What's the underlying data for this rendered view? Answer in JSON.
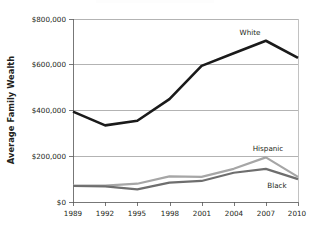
{
  "chart_data": {
    "type": "line",
    "title": "",
    "xlabel": "",
    "ylabel": "Average Family Wealth",
    "categories": [
      "1989",
      "1992",
      "1995",
      "1998",
      "2001",
      "2004",
      "2007",
      "2010"
    ],
    "ylim": [
      0,
      800000
    ],
    "yticks": [
      0,
      200000,
      400000,
      600000,
      800000
    ],
    "ytick_labels": [
      "$0",
      "$200,000",
      "$400,000",
      "$600,000",
      "$800,000"
    ],
    "grid": true,
    "legend_position": "inline-labels",
    "series": [
      {
        "name": "White",
        "color": "#1a1a1a",
        "values": [
          395000,
          335000,
          355000,
          450000,
          595000,
          650000,
          705000,
          630000
        ]
      },
      {
        "name": "Hispanic",
        "color": "#a6a6a6",
        "values": [
          72000,
          72000,
          80000,
          112000,
          110000,
          145000,
          195000,
          110000
        ]
      },
      {
        "name": "Black",
        "color": "#6e6e6e",
        "values": [
          70000,
          68000,
          55000,
          85000,
          92000,
          128000,
          145000,
          100000
        ]
      }
    ]
  },
  "labels": {
    "y_axis_title": "Average Family Wealth",
    "series_white": "White",
    "series_hispanic": "Hispanic",
    "series_black": "Black"
  },
  "yticks": {
    "t0": "$0",
    "t1": "$200,000",
    "t2": "$400,000",
    "t3": "$600,000",
    "t4": "$800,000"
  },
  "xticks": {
    "x0": "1989",
    "x1": "1992",
    "x2": "1995",
    "x3": "1998",
    "x4": "2001",
    "x5": "2004",
    "x6": "2007",
    "x7": "2010"
  }
}
